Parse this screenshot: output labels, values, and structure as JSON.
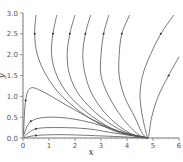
{
  "chart_data": {
    "type": "line",
    "title": "",
    "xlabel": "x",
    "ylabel": "y",
    "xlim": [
      0,
      6
    ],
    "ylim": [
      0,
      3.0
    ],
    "xticks": [
      "0",
      "1",
      "2",
      "3",
      "4",
      "5",
      "6"
    ],
    "yticks": [
      "0.0",
      "0.5",
      "1.0",
      "1.5",
      "2.0",
      "2.5",
      "3.0"
    ],
    "grid": false,
    "legend": [],
    "series": [
      {
        "name": "traj1",
        "points": [
          [
            0.5,
            2.95
          ],
          [
            0.45,
            2.5
          ],
          [
            0.55,
            2.0
          ],
          [
            0.9,
            1.5
          ],
          [
            1.5,
            1.0
          ],
          [
            2.5,
            0.5
          ],
          [
            3.6,
            0.15
          ],
          [
            4.8,
            0
          ]
        ]
      },
      {
        "name": "traj2",
        "points": [
          [
            1.3,
            2.95
          ],
          [
            1.15,
            2.5
          ],
          [
            1.1,
            2.0
          ],
          [
            1.3,
            1.5
          ],
          [
            1.8,
            1.0
          ],
          [
            2.7,
            0.5
          ],
          [
            3.7,
            0.15
          ],
          [
            4.8,
            0
          ]
        ]
      },
      {
        "name": "traj3",
        "points": [
          [
            2.0,
            2.95
          ],
          [
            1.8,
            2.5
          ],
          [
            1.7,
            2.0
          ],
          [
            1.8,
            1.5
          ],
          [
            2.2,
            1.0
          ],
          [
            3.0,
            0.5
          ],
          [
            3.9,
            0.15
          ],
          [
            4.8,
            0
          ]
        ]
      },
      {
        "name": "traj4",
        "points": [
          [
            2.6,
            2.95
          ],
          [
            2.4,
            2.5
          ],
          [
            2.3,
            2.0
          ],
          [
            2.4,
            1.5
          ],
          [
            2.7,
            1.0
          ],
          [
            3.3,
            0.5
          ],
          [
            4.1,
            0.12
          ],
          [
            4.8,
            0
          ]
        ]
      },
      {
        "name": "traj5",
        "points": [
          [
            3.3,
            2.95
          ],
          [
            3.1,
            2.5
          ],
          [
            3.0,
            2.0
          ],
          [
            3.0,
            1.5
          ],
          [
            3.3,
            1.0
          ],
          [
            3.8,
            0.5
          ],
          [
            4.4,
            0.1
          ],
          [
            4.8,
            0
          ]
        ]
      },
      {
        "name": "traj6",
        "points": [
          [
            4.1,
            2.95
          ],
          [
            3.8,
            2.5
          ],
          [
            3.7,
            2.0
          ],
          [
            3.7,
            1.5
          ],
          [
            3.9,
            1.0
          ],
          [
            4.3,
            0.5
          ],
          [
            4.6,
            0.1
          ],
          [
            4.8,
            0
          ]
        ]
      },
      {
        "name": "traj7",
        "points": [
          [
            5.8,
            2.95
          ],
          [
            5.3,
            2.5
          ],
          [
            4.9,
            2.0
          ],
          [
            4.6,
            1.5
          ],
          [
            4.5,
            1.0
          ],
          [
            4.6,
            0.5
          ],
          [
            4.75,
            0.1
          ],
          [
            4.8,
            0
          ]
        ]
      },
      {
        "name": "traj8",
        "points": [
          [
            6.0,
            1.95
          ],
          [
            5.6,
            1.5
          ],
          [
            5.2,
            1.0
          ],
          [
            4.95,
            0.5
          ],
          [
            4.85,
            0.1
          ],
          [
            4.8,
            0
          ]
        ]
      },
      {
        "name": "traj9",
        "points": [
          [
            0.02,
            0.1
          ],
          [
            0.1,
            0.9
          ],
          [
            0.3,
            1.2
          ],
          [
            0.8,
            1.1
          ],
          [
            1.5,
            0.85
          ],
          [
            2.5,
            0.5
          ],
          [
            3.6,
            0.18
          ],
          [
            4.8,
            0
          ]
        ]
      },
      {
        "name": "traj10",
        "points": [
          [
            0.02,
            0.05
          ],
          [
            0.3,
            0.4
          ],
          [
            1.0,
            0.5
          ],
          [
            2.0,
            0.45
          ],
          [
            3.0,
            0.3
          ],
          [
            4.0,
            0.1
          ],
          [
            4.8,
            0
          ]
        ]
      },
      {
        "name": "traj11",
        "points": [
          [
            0.02,
            0.02
          ],
          [
            0.5,
            0.22
          ],
          [
            1.5,
            0.25
          ],
          [
            2.5,
            0.22
          ],
          [
            3.5,
            0.12
          ],
          [
            4.8,
            0
          ]
        ]
      },
      {
        "name": "traj12",
        "points": [
          [
            0.02,
            0.0
          ],
          [
            0.5,
            0.06
          ],
          [
            1.5,
            0.08
          ],
          [
            3.0,
            0.05
          ],
          [
            4.8,
            0
          ]
        ]
      }
    ]
  }
}
